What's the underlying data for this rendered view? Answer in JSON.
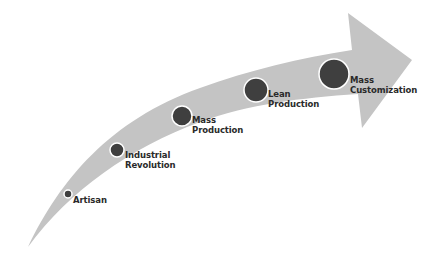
{
  "diagram": {
    "type": "curved-arrow-timeline",
    "colors": {
      "arrow": "#c4c4c4",
      "node": "#3f3f3f",
      "node_ring": "#ffffff",
      "text": "#2a2a2a",
      "background": "#ffffff"
    },
    "stages": [
      {
        "line1": "Artisan",
        "line2": ""
      },
      {
        "line1": "Industrial",
        "line2": "Revolution"
      },
      {
        "line1": "Mass",
        "line2": "Production"
      },
      {
        "line1": "Lean",
        "line2": "Production"
      },
      {
        "line1": "Mass",
        "line2": "Customization"
      }
    ]
  }
}
